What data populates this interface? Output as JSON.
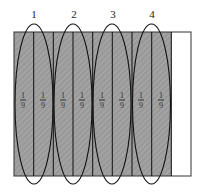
{
  "diagram": {
    "total_parts": 9,
    "shaded_parts": 8,
    "fill_color": "#9a9a9a",
    "group_labels": [
      "1",
      "2",
      "3",
      "4"
    ],
    "fractions": [
      {
        "num": "1",
        "den": "9"
      },
      {
        "num": "1",
        "den": "9"
      },
      {
        "num": "1",
        "den": "9"
      },
      {
        "num": "1",
        "den": "9"
      },
      {
        "num": "1",
        "den": "9"
      },
      {
        "num": "1",
        "den": "9"
      },
      {
        "num": "1",
        "den": "9"
      },
      {
        "num": "1",
        "den": "9"
      }
    ]
  }
}
